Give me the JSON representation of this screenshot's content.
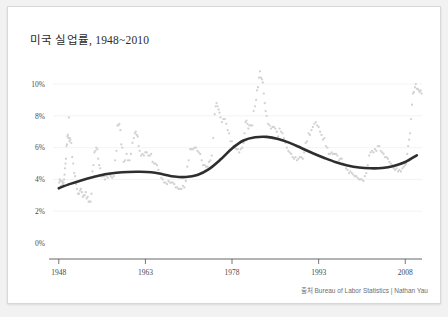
{
  "figure": {
    "title": "미국 실업률, 1948~2010",
    "source_note": "출처 Bureau of Labor Statistics | Nathan Yau",
    "colors": {
      "background": "#f2f2f2",
      "panel": "#ffffff",
      "border": "#d8d8d8",
      "scatter": "#d2d2d2",
      "trend": "#2e2e2e",
      "axis": "#555555",
      "grid": "#f0f0f2",
      "text": "#4a4a4a"
    }
  },
  "chart_data": {
    "type": "scatter",
    "title": "미국 실업률, 1948~2010",
    "xlabel": "",
    "ylabel": "",
    "xlim": [
      1947.0,
      2010.9
    ],
    "ylim": [
      0,
      11.2
    ],
    "grid": true,
    "legend_position": "none",
    "y_tick_labels": [
      "0%",
      "2%",
      "4%",
      "6%",
      "8%",
      "10%"
    ],
    "y_tick_values": [
      0,
      2,
      4,
      6,
      8,
      10
    ],
    "x_tick_labels": [
      "1948",
      "1963",
      "1978",
      "1993",
      "2008"
    ],
    "x_tick_values": [
      1948,
      1963,
      1978,
      1993,
      2008
    ],
    "series": [
      {
        "name": "Monthly unemployment rate",
        "kind": "scatter",
        "marker": "dot",
        "color": "#d2d2d2",
        "x": [
          1948.0,
          1948.08,
          1948.17,
          1948.25,
          1948.33,
          1948.42,
          1948.5,
          1948.58,
          1948.67,
          1948.75,
          1948.83,
          1948.92,
          1949.0,
          1949.08,
          1949.17,
          1949.25,
          1949.33,
          1949.42,
          1949.5,
          1949.58,
          1949.67,
          1949.75,
          1949.83,
          1949.92,
          1950.0,
          1950.17,
          1950.33,
          1950.5,
          1950.67,
          1950.83,
          1951.0,
          1951.17,
          1951.33,
          1951.5,
          1951.67,
          1951.83,
          1952.0,
          1952.17,
          1952.33,
          1952.5,
          1952.67,
          1952.83,
          1953.0,
          1953.17,
          1953.33,
          1953.5,
          1953.67,
          1953.83,
          1954.0,
          1954.17,
          1954.33,
          1954.5,
          1954.67,
          1954.83,
          1955.0,
          1955.17,
          1955.33,
          1955.5,
          1955.67,
          1955.83,
          1956.0,
          1956.25,
          1956.5,
          1956.75,
          1957.0,
          1957.25,
          1957.5,
          1957.75,
          1958.0,
          1958.17,
          1958.33,
          1958.5,
          1958.67,
          1958.83,
          1959.0,
          1959.25,
          1959.5,
          1959.75,
          1960.0,
          1960.25,
          1960.5,
          1960.75,
          1961.0,
          1961.17,
          1961.33,
          1961.5,
          1961.67,
          1961.83,
          1962.0,
          1962.25,
          1962.5,
          1962.75,
          1963.0,
          1963.25,
          1963.5,
          1963.75,
          1964.0,
          1964.25,
          1964.5,
          1964.75,
          1965.0,
          1965.25,
          1965.5,
          1965.75,
          1966.0,
          1966.25,
          1966.5,
          1966.75,
          1967.0,
          1967.25,
          1967.5,
          1967.75,
          1968.0,
          1968.25,
          1968.5,
          1968.75,
          1969.0,
          1969.25,
          1969.5,
          1969.75,
          1970.0,
          1970.25,
          1970.5,
          1970.75,
          1971.0,
          1971.25,
          1971.5,
          1971.75,
          1972.0,
          1972.25,
          1972.5,
          1972.75,
          1973.0,
          1973.25,
          1973.5,
          1973.75,
          1974.0,
          1974.25,
          1974.5,
          1974.75,
          1975.0,
          1975.17,
          1975.33,
          1975.5,
          1975.67,
          1975.83,
          1976.0,
          1976.25,
          1976.5,
          1976.75,
          1977.0,
          1977.25,
          1977.5,
          1977.75,
          1978.0,
          1978.25,
          1978.5,
          1978.75,
          1979.0,
          1979.25,
          1979.5,
          1979.75,
          1980.0,
          1980.17,
          1980.33,
          1980.5,
          1980.67,
          1980.83,
          1981.0,
          1981.25,
          1981.5,
          1981.75,
          1982.0,
          1982.17,
          1982.33,
          1982.5,
          1982.67,
          1982.83,
          1983.0,
          1983.17,
          1983.33,
          1983.5,
          1983.67,
          1983.83,
          1984.0,
          1984.25,
          1984.5,
          1984.75,
          1985.0,
          1985.25,
          1985.5,
          1985.75,
          1986.0,
          1986.25,
          1986.5,
          1986.75,
          1987.0,
          1987.25,
          1987.5,
          1987.75,
          1988.0,
          1988.25,
          1988.5,
          1988.75,
          1989.0,
          1989.25,
          1989.5,
          1989.75,
          1990.0,
          1990.25,
          1990.5,
          1990.75,
          1991.0,
          1991.25,
          1991.5,
          1991.75,
          1992.0,
          1992.25,
          1992.5,
          1992.75,
          1993.0,
          1993.25,
          1993.5,
          1993.75,
          1994.0,
          1994.25,
          1994.5,
          1994.75,
          1995.0,
          1995.25,
          1995.5,
          1995.75,
          1996.0,
          1996.25,
          1996.5,
          1996.75,
          1997.0,
          1997.25,
          1997.5,
          1997.75,
          1998.0,
          1998.25,
          1998.5,
          1998.75,
          1999.0,
          1999.25,
          1999.5,
          1999.75,
          2000.0,
          2000.25,
          2000.5,
          2000.75,
          2001.0,
          2001.25,
          2001.5,
          2001.75,
          2002.0,
          2002.25,
          2002.5,
          2002.75,
          2003.0,
          2003.25,
          2003.5,
          2003.75,
          2004.0,
          2004.25,
          2004.5,
          2004.75,
          2005.0,
          2005.25,
          2005.5,
          2005.75,
          2006.0,
          2006.25,
          2006.5,
          2006.75,
          2007.0,
          2007.25,
          2007.5,
          2007.75,
          2008.0,
          2008.17,
          2008.33,
          2008.5,
          2008.67,
          2008.83,
          2009.0,
          2009.17,
          2009.33,
          2009.5,
          2009.67,
          2009.83,
          2010.0,
          2010.17,
          2010.33,
          2010.5,
          2010.67,
          2010.83
        ],
        "y": [
          3.4,
          3.8,
          4.0,
          3.9,
          3.5,
          3.6,
          3.6,
          3.9,
          3.8,
          3.7,
          3.8,
          4.0,
          4.3,
          4.7,
          5.0,
          5.3,
          6.1,
          6.2,
          6.7,
          6.8,
          6.6,
          7.9,
          6.4,
          6.6,
          6.5,
          6.3,
          5.4,
          5.0,
          4.4,
          4.2,
          3.7,
          3.4,
          3.1,
          3.1,
          3.3,
          3.4,
          3.2,
          2.9,
          3.0,
          3.0,
          3.2,
          2.8,
          2.9,
          2.6,
          2.6,
          2.6,
          3.1,
          4.5,
          4.9,
          5.7,
          5.8,
          6.0,
          5.9,
          5.3,
          4.9,
          4.7,
          4.2,
          4.2,
          4.2,
          4.2,
          4.0,
          4.2,
          4.1,
          4.3,
          4.2,
          4.1,
          4.2,
          5.2,
          5.8,
          7.4,
          7.4,
          7.5,
          7.1,
          6.2,
          6.0,
          5.1,
          5.2,
          5.6,
          5.2,
          5.2,
          5.6,
          6.3,
          6.6,
          6.9,
          7.0,
          6.8,
          6.7,
          6.1,
          5.8,
          5.5,
          5.6,
          5.5,
          5.7,
          5.7,
          5.5,
          5.5,
          5.6,
          5.1,
          5.0,
          5.0,
          4.9,
          4.6,
          4.4,
          4.1,
          4.0,
          3.8,
          3.8,
          3.7,
          3.9,
          3.8,
          3.8,
          3.8,
          3.7,
          3.5,
          3.5,
          3.4,
          3.4,
          3.4,
          3.6,
          3.5,
          3.9,
          4.8,
          5.2,
          5.9,
          5.9,
          5.9,
          6.0,
          6.0,
          5.8,
          5.7,
          5.6,
          5.2,
          4.9,
          4.9,
          4.8,
          4.8,
          5.1,
          5.2,
          5.5,
          6.6,
          8.1,
          8.6,
          8.8,
          8.6,
          8.4,
          8.2,
          7.9,
          7.6,
          7.8,
          7.8,
          7.5,
          7.1,
          6.9,
          6.4,
          6.4,
          6.1,
          6.0,
          5.9,
          5.9,
          5.7,
          5.9,
          6.0,
          6.3,
          6.9,
          7.6,
          7.7,
          7.5,
          7.2,
          7.4,
          7.4,
          7.4,
          8.3,
          8.6,
          9.0,
          9.6,
          9.8,
          10.4,
          10.8,
          10.4,
          10.3,
          10.1,
          9.4,
          8.8,
          8.3,
          8.0,
          7.5,
          7.4,
          7.2,
          7.3,
          7.3,
          7.2,
          7.0,
          6.7,
          7.2,
          7.0,
          6.9,
          6.6,
          6.3,
          6.0,
          5.8,
          5.7,
          5.6,
          5.4,
          5.3,
          5.4,
          5.2,
          5.3,
          5.4,
          5.4,
          5.3,
          5.7,
          6.3,
          6.4,
          6.9,
          6.8,
          7.1,
          7.3,
          7.5,
          7.6,
          7.4,
          7.3,
          7.0,
          6.8,
          6.5,
          6.6,
          6.1,
          6.0,
          5.6,
          5.6,
          5.7,
          5.6,
          5.6,
          5.6,
          5.5,
          5.2,
          5.3,
          5.3,
          5.0,
          4.9,
          4.7,
          4.6,
          4.4,
          4.5,
          4.4,
          4.3,
          4.2,
          4.2,
          4.1,
          4.0,
          4.0,
          4.0,
          3.9,
          4.2,
          4.4,
          4.9,
          5.5,
          5.7,
          5.8,
          5.7,
          5.9,
          5.8,
          6.1,
          6.1,
          5.8,
          5.7,
          5.6,
          5.4,
          5.4,
          5.3,
          5.1,
          5.0,
          4.9,
          4.7,
          4.6,
          4.7,
          4.5,
          4.6,
          4.5,
          4.7,
          4.8,
          4.9,
          5.0,
          5.6,
          6.1,
          6.5,
          6.9,
          7.8,
          8.7,
          9.4,
          9.5,
          9.8,
          10.0,
          9.7,
          9.7,
          9.6,
          9.5,
          9.6,
          9.4
        ]
      },
      {
        "name": "Smoothed trend (LOESS)",
        "kind": "line",
        "color": "#2e2e2e",
        "x": [
          1948,
          1950,
          1952,
          1954,
          1956,
          1958,
          1960,
          1962,
          1964,
          1966,
          1968,
          1970,
          1972,
          1974,
          1976,
          1978,
          1980,
          1982,
          1984,
          1986,
          1988,
          1990,
          1992,
          1994,
          1996,
          1998,
          2000,
          2002,
          2004,
          2006,
          2008,
          2010
        ],
        "y": [
          3.45,
          3.72,
          3.95,
          4.15,
          4.32,
          4.42,
          4.47,
          4.48,
          4.45,
          4.33,
          4.18,
          4.15,
          4.28,
          4.65,
          5.25,
          5.95,
          6.45,
          6.65,
          6.68,
          6.55,
          6.3,
          5.98,
          5.65,
          5.35,
          5.08,
          4.88,
          4.75,
          4.7,
          4.72,
          4.85,
          5.1,
          5.52
        ]
      }
    ]
  }
}
